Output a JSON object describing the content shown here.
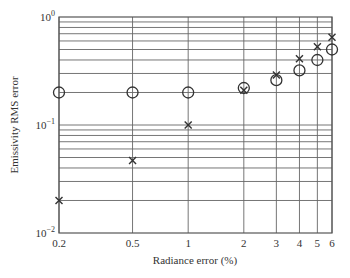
{
  "chart_data": {
    "type": "scatter",
    "title": "",
    "xlabel": "Radiance error (%)",
    "ylabel": "Emissivity RMS error",
    "xscale": "log",
    "yscale": "log",
    "xlim": [
      0.2,
      6
    ],
    "ylim": [
      0.01,
      1
    ],
    "x_ticks": [
      0.2,
      0.5,
      1,
      2,
      3,
      4,
      5,
      6
    ],
    "x_tick_labels": [
      "0.2",
      "0.5",
      "1",
      "2",
      "3",
      "4",
      "5",
      "6"
    ],
    "y_tick_labels": [
      {
        "base": "10",
        "exp": "0",
        "value": 1
      },
      {
        "base": "10",
        "exp": "−1",
        "value": 0.1
      },
      {
        "base": "10",
        "exp": "−2",
        "value": 0.01
      }
    ],
    "grid": true,
    "legend": null,
    "x": [
      0.2,
      0.5,
      1,
      2,
      3,
      4,
      5,
      6
    ],
    "series": [
      {
        "name": "circles",
        "marker": "circle",
        "values": [
          0.2,
          0.2,
          0.2,
          0.22,
          0.26,
          0.32,
          0.4,
          0.5
        ]
      },
      {
        "name": "crosses",
        "marker": "x",
        "values": [
          0.02,
          0.047,
          0.1,
          0.21,
          0.29,
          0.41,
          0.53,
          0.65
        ]
      }
    ]
  }
}
